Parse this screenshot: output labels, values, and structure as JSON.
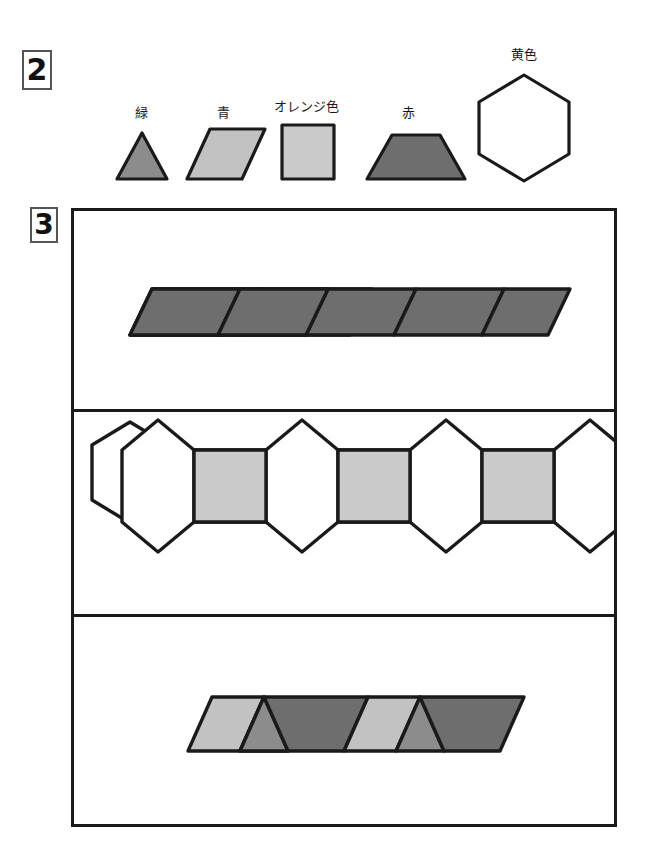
{
  "sections": [
    {
      "id": "section-2",
      "number": "2"
    },
    {
      "id": "section-3",
      "number": "3"
    }
  ],
  "legend": {
    "title_number": "2",
    "items": [
      {
        "name": "green-triangle",
        "label": "緑",
        "shape": "triangle",
        "fill": "#8c8c8c",
        "stroke": "#1a1a1a"
      },
      {
        "name": "blue-rhombus",
        "label": "青",
        "shape": "rhombus",
        "fill": "#c2c2c2",
        "stroke": "#1a1a1a"
      },
      {
        "name": "orange-square",
        "label": "オレンジ色",
        "shape": "square",
        "fill": "#cacaca",
        "stroke": "#1a1a1a"
      },
      {
        "name": "red-trapezoid",
        "label": "赤",
        "shape": "trapezoid",
        "fill": "#6e6e6e",
        "stroke": "#1a1a1a"
      },
      {
        "name": "yellow-hexagon",
        "label": "黄色",
        "shape": "hexagon",
        "fill": "#ffffff",
        "stroke": "#1a1a1a"
      }
    ]
  },
  "panel": {
    "title_number": "3",
    "rows": [
      {
        "name": "row-red-trapezoid-strip",
        "description": "strip of five red trapezoids alternating orientation",
        "pieces": [
          {
            "piece": "red-trapezoid",
            "orientation": "up",
            "fill": "#6e6e6e"
          },
          {
            "piece": "red-trapezoid",
            "orientation": "down",
            "fill": "#6e6e6e"
          },
          {
            "piece": "red-trapezoid",
            "orientation": "up",
            "fill": "#6e6e6e"
          },
          {
            "piece": "red-trapezoid",
            "orientation": "down",
            "fill": "#6e6e6e"
          },
          {
            "piece": "red-trapezoid",
            "orientation": "up",
            "fill": "#6e6e6e"
          }
        ]
      },
      {
        "name": "row-hexagon-square-chain",
        "description": "four yellow hexagons joined by three orange squares",
        "pieces": [
          {
            "piece": "yellow-hexagon",
            "fill": "#ffffff"
          },
          {
            "piece": "orange-square",
            "fill": "#cacaca"
          },
          {
            "piece": "yellow-hexagon",
            "fill": "#ffffff"
          },
          {
            "piece": "orange-square",
            "fill": "#cacaca"
          },
          {
            "piece": "yellow-hexagon",
            "fill": "#ffffff"
          },
          {
            "piece": "orange-square",
            "fill": "#cacaca"
          },
          {
            "piece": "yellow-hexagon",
            "fill": "#ffffff"
          }
        ]
      },
      {
        "name": "row-rhombus-triangle-strip",
        "description": "slanted strip of blue rhombi, green triangles and red rhombi",
        "pieces": [
          {
            "piece": "blue-rhombus",
            "fill": "#c2c2c2"
          },
          {
            "piece": "green-triangle",
            "fill": "#8c8c8c"
          },
          {
            "piece": "red-rhombus",
            "fill": "#6e6e6e"
          },
          {
            "piece": "blue-rhombus",
            "fill": "#c2c2c2"
          },
          {
            "piece": "green-triangle",
            "fill": "#8c8c8c"
          },
          {
            "piece": "red-rhombus",
            "fill": "#6e6e6e"
          }
        ]
      }
    ]
  },
  "colors": {
    "outline": "#1a1a1a",
    "badge_border": "#555555",
    "green": "#8c8c8c",
    "blue": "#c2c2c2",
    "orange": "#cacaca",
    "red": "#6e6e6e",
    "yellow": "#ffffff",
    "background": "#ffffff"
  }
}
